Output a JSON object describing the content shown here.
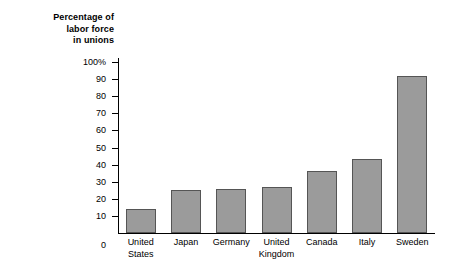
{
  "chart_data": {
    "type": "bar",
    "title": "Percentage of labor force in unions",
    "title_lines": [
      "Percentage of",
      "labor force",
      "in unions"
    ],
    "xlabel": "",
    "ylabel": "",
    "ylim": [
      0,
      100
    ],
    "yticks": [
      0,
      10,
      20,
      30,
      40,
      50,
      60,
      70,
      80,
      90,
      100
    ],
    "ytick_labels": [
      "0",
      "10",
      "20",
      "30",
      "40",
      "50",
      "60",
      "70",
      "80",
      "90",
      "100%"
    ],
    "grid": false,
    "legend": null,
    "bar_color": "#9b9b9b",
    "bar_border_color": "#555555",
    "axis_color": "#000000",
    "categories": [
      "United States",
      "Japan",
      "Germany",
      "United Kingdom",
      "Canada",
      "Italy",
      "Sweden"
    ],
    "category_lines": [
      [
        "United",
        "States"
      ],
      [
        "Japan"
      ],
      [
        "Germany"
      ],
      [
        "United",
        "Kingdom"
      ],
      [
        "Canada"
      ],
      [
        "Italy"
      ],
      [
        "Sweden"
      ]
    ],
    "values": [
      14,
      25,
      26,
      27,
      36,
      43,
      92
    ]
  }
}
